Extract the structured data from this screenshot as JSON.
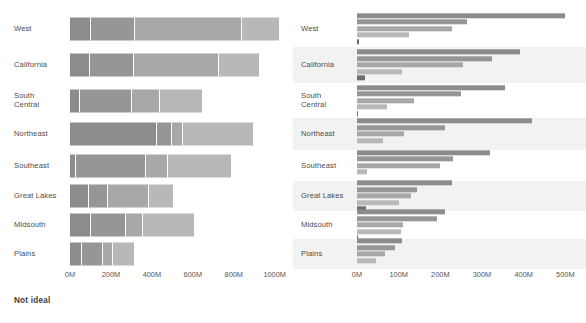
{
  "panels": [
    {
      "id": "stacked",
      "caption": "Not ideal",
      "axis": {
        "ticks": [
          "0M",
          "200M",
          "400M",
          "600M",
          "800M",
          "1000M"
        ],
        "values": [
          0,
          200,
          400,
          600,
          800,
          1000
        ],
        "max": 1060
      }
    },
    {
      "id": "grouped",
      "caption": "Better",
      "axis": {
        "ticks": [
          "0M",
          "100M",
          "200M",
          "300M",
          "400M",
          "500M"
        ],
        "values": [
          0,
          100,
          200,
          300,
          400,
          500
        ],
        "max": 540
      }
    }
  ],
  "regions": [
    "West",
    "California",
    "South\nCentral",
    "Northeast",
    "Southeast",
    "Great Lakes",
    "Midsouth",
    "Plains"
  ],
  "colors": {
    "series": [
      "#8c8c8c",
      "#969696",
      "#a8a8a8",
      "#b8b8b8",
      "#6e6e6e"
    ],
    "band": "#f2f2f2",
    "label_text": "#4c4c4c",
    "tick_text": "#555555",
    "caption_text": "#3d3d3d",
    "background": "#ffffff"
  },
  "chart_data": [
    {
      "type": "bar",
      "orientation": "horizontal",
      "stacked": true,
      "title": "Not ideal",
      "xlabel": "",
      "ylabel": "",
      "xlim": [
        0,
        1060
      ],
      "grid": false,
      "legend": "none",
      "unit": "M",
      "categories": [
        "West",
        "California",
        "South Central",
        "Northeast",
        "Southeast",
        "Great Lakes",
        "Midsouth",
        "Plains"
      ],
      "series": [
        {
          "name": "Series 1",
          "color": "#8c8c8c",
          "values": [
            105,
            100,
            50,
            425,
            30
          ]
        },
        {
          "name": "Series 2",
          "color": "#969696",
          "values": [
            215,
            215,
            255,
            0,
            340
          ]
        },
        {
          "name": "Series 3",
          "color": "#a8a8a8",
          "values": [
            520,
            415,
            0,
            0,
            0
          ]
        },
        {
          "name": "Series 4",
          "color": "#b8b8b8",
          "values": [
            0,
            0,
            0,
            0,
            0
          ]
        }
      ],
      "stacks": [
        {
          "category": "West",
          "segments": [
            105,
            215,
            520,
            180
          ],
          "total": 1020
        },
        {
          "category": "California",
          "segments": [
            100,
            215,
            415,
            195
          ],
          "total": 925
        },
        {
          "category": "South Central",
          "segments": [
            50,
            255,
            135,
            205
          ],
          "total": 645
        },
        {
          "category": "Northeast",
          "segments": [
            425,
            75,
            50,
            345
          ],
          "total": 895
        },
        {
          "category": "Southeast",
          "segments": [
            30,
            340,
            110,
            305
          ],
          "total": 785
        },
        {
          "category": "Great Lakes",
          "segments": [
            95,
            90,
            200,
            120
          ],
          "total": 505
        },
        {
          "category": "Midsouth",
          "segments": [
            105,
            170,
            80,
            250
          ],
          "total": 605
        },
        {
          "category": "Plains",
          "segments": [
            60,
            100,
            50,
            105
          ],
          "total": 315
        }
      ]
    },
    {
      "type": "bar",
      "orientation": "horizontal",
      "stacked": false,
      "title": "Better",
      "xlabel": "",
      "ylabel": "",
      "xlim": [
        0,
        540
      ],
      "grid": false,
      "legend": "none",
      "unit": "M",
      "categories": [
        "West",
        "California",
        "South Central",
        "Northeast",
        "Southeast",
        "Great Lakes",
        "Midsouth",
        "Plains"
      ],
      "groups": [
        {
          "category": "West",
          "values": [
            500,
            263,
            228,
            125,
            5
          ]
        },
        {
          "category": "California",
          "values": [
            390,
            325,
            255,
            108,
            18
          ]
        },
        {
          "category": "South Central",
          "values": [
            355,
            250,
            137,
            72,
            3
          ]
        },
        {
          "category": "Northeast",
          "values": [
            420,
            212,
            113,
            62,
            0
          ]
        },
        {
          "category": "Southeast",
          "values": [
            320,
            230,
            198,
            25,
            0
          ]
        },
        {
          "category": "Great Lakes",
          "values": [
            228,
            143,
            130,
            100,
            22
          ]
        },
        {
          "category": "Midsouth",
          "values": [
            212,
            192,
            110,
            105,
            2
          ]
        },
        {
          "category": "Plains",
          "values": [
            108,
            90,
            68,
            45,
            0
          ]
        }
      ]
    }
  ],
  "layout": {
    "row_tops": [
      10,
      47,
      83,
      118,
      150,
      181,
      211,
      239
    ],
    "row_heights": [
      37,
      36,
      35,
      32,
      31,
      30,
      28,
      30
    ],
    "axis_top": 268,
    "left_plot_origin": 70,
    "right_plot_origin": 64,
    "banded_rows": [
      1,
      3,
      5,
      7
    ]
  }
}
